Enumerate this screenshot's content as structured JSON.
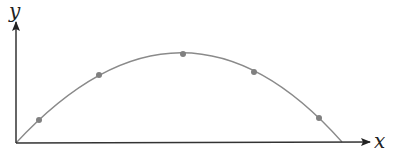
{
  "diagram": {
    "type": "projectile-trajectory",
    "axes": {
      "x_label": "x",
      "y_label": "y",
      "origin": [
        16,
        143
      ],
      "x_arrow_tip": [
        370,
        142
      ],
      "y_arrow_tip": [
        16,
        22
      ]
    },
    "curve": {
      "shape": "parabola",
      "start": [
        16,
        143
      ],
      "apex": [
        183,
        53
      ],
      "end": [
        342,
        142
      ],
      "color": "#8a8a8a"
    },
    "points": [
      {
        "x": 39,
        "y": 120
      },
      {
        "x": 99,
        "y": 75
      },
      {
        "x": 183,
        "y": 54
      },
      {
        "x": 254,
        "y": 72
      },
      {
        "x": 319,
        "y": 118
      }
    ],
    "colors": {
      "axis": "#333333",
      "curve": "#8a8a8a",
      "point": "#808080"
    }
  }
}
